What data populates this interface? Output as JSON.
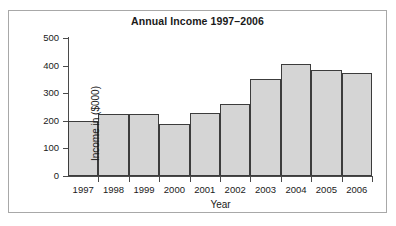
{
  "chart_data": {
    "type": "bar",
    "title": "Annual Income 1997–2006",
    "xlabel": "Year",
    "ylabel": "Income in ($000)",
    "categories": [
      "1997",
      "1998",
      "1999",
      "2000",
      "2001",
      "2002",
      "2003",
      "2004",
      "2005",
      "2006"
    ],
    "values": [
      200,
      225,
      225,
      190,
      230,
      260,
      352,
      405,
      383,
      372
    ],
    "ylim": [
      0,
      500
    ],
    "yticks": [
      0,
      100,
      200,
      300,
      400,
      500
    ],
    "ytick_labels": [
      "0",
      "100",
      "200",
      "300",
      "400",
      "500"
    ],
    "grid": false,
    "legend": false,
    "bar_fill_color": "#d5d5d5",
    "bar_edge_color": "#3c3c3c",
    "axis_color": "#4a4a4a",
    "frame_color": "#a8a8a8",
    "background_color": "#ffffff",
    "text_color": "#1a1a1a"
  }
}
